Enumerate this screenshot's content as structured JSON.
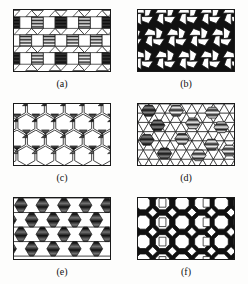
{
  "figure": {
    "title": "",
    "background_color": "#ffffff",
    "line_color": "#1a1a1a",
    "fill_dark": "#111111",
    "fill_light": "#ffffff",
    "fill_hatch": "#4a4a4a",
    "panel_count": 6,
    "layout": "2 columns x 3 rows",
    "panels": [
      {
        "id": "a",
        "caption": "(a)",
        "pattern_name": "square-triangle-tiling",
        "description": "Rows of squares separated by bands of alternating up/down triangles; some squares shaded with horizontal hatching.",
        "shapes": [
          "square",
          "triangle"
        ],
        "shaded_tiles": [
          "square"
        ],
        "shading": "horizontal-hatch"
      },
      {
        "id": "b",
        "caption": "(b)",
        "pattern_name": "pinwheel-pentagon-tiling",
        "description": "White rounded squares and pentagons arranged in pinwheels with solid black triangular interstices.",
        "shapes": [
          "pentagon",
          "square",
          "triangle"
        ],
        "shaded_tiles": [
          "triangle"
        ],
        "shading": "solid-black"
      },
      {
        "id": "c",
        "caption": "(c)",
        "pattern_name": "hexagon-triangle-tiling",
        "description": "Large white hexagons in honeycomb arrangement with small dark bowtie triangle pairs at the junctions.",
        "shapes": [
          "hexagon",
          "triangle"
        ],
        "shaded_tiles": [
          "triangle"
        ],
        "shading": "dark-hatch"
      },
      {
        "id": "d",
        "caption": "(d)",
        "pattern_name": "triangle-hexagon-lattice",
        "description": "Triangular lattice of white triangles with scattered hexagons filled by horizontal line hatching.",
        "shapes": [
          "triangle",
          "hexagon"
        ],
        "shaded_tiles": [
          "hexagon"
        ],
        "shading": "horizontal-hatch"
      },
      {
        "id": "e",
        "caption": "(e)",
        "pattern_name": "hourglass-row-tiling",
        "description": "Horizontal bands of large white cells separated by straight lines, with shaded vertical hourglass (bowtie) motifs at regular intervals.",
        "shapes": [
          "hourglass",
          "rectangle"
        ],
        "shaded_tiles": [
          "hourglass"
        ],
        "shading": "dark-hatch"
      },
      {
        "id": "f",
        "caption": "(f)",
        "pattern_name": "octagon-square-tiling",
        "description": "White octagons and squares with solid black triangular regions, columns of stacked white squares.",
        "shapes": [
          "octagon",
          "square",
          "triangle"
        ],
        "shaded_tiles": [
          "triangle"
        ],
        "shading": "solid-black"
      }
    ]
  }
}
